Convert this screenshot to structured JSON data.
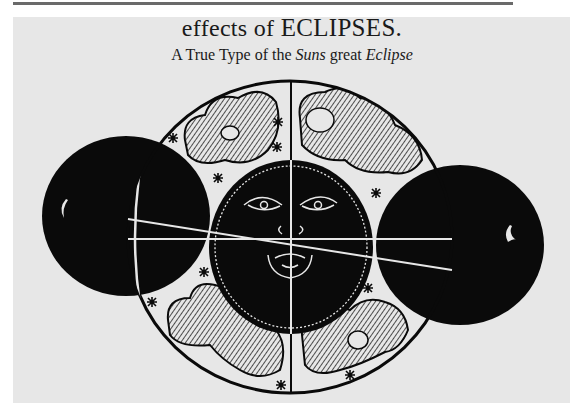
{
  "header": {
    "title_prefix": "effects of",
    "title_caps": "ECLIPSES.",
    "subtitle_a": "A True Type of the",
    "subtitle_italic_1": "Suns",
    "subtitle_b": "great",
    "subtitle_italic_2": "Eclipse"
  },
  "figure": {
    "colors": {
      "ink": "#0a0a0a",
      "paper": "#e7e7e7",
      "highlight": "#e7e7e7"
    }
  }
}
